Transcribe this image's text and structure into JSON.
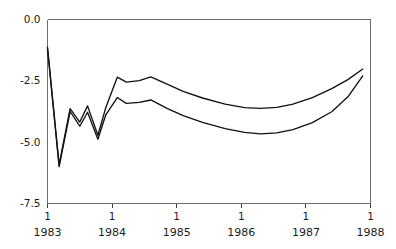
{
  "chart_data": {
    "type": "line",
    "title": "",
    "subtitle": "",
    "xlabel": "",
    "ylabel": "",
    "xlim": [
      1983.0,
      1988.0
    ],
    "ylim": [
      -7.5,
      0.0
    ],
    "grid": false,
    "legend": null,
    "legend_position": "none",
    "y_ticks": [
      0.0,
      -2.5,
      -5.0,
      -7.5
    ],
    "y_tick_labels": [
      "0.0",
      "-2.5",
      "-5.0",
      "-7.5"
    ],
    "x_ticks": [
      1983,
      1984,
      1985,
      1986,
      1987,
      1988
    ],
    "x_tick_labels": [
      "1",
      "1",
      "1",
      "1",
      "1",
      "1"
    ],
    "x_year_labels": [
      "1983",
      "1984",
      "1985",
      "1986",
      "1987",
      "1988"
    ],
    "line_color": "#111111",
    "axis_color": "#6e6e6e",
    "series": [
      {
        "name": "upper",
        "x": [
          1983.0,
          1983.18,
          1983.35,
          1983.5,
          1983.62,
          1983.78,
          1983.9,
          1984.08,
          1984.22,
          1984.42,
          1984.6,
          1984.85,
          1985.1,
          1985.4,
          1985.75,
          1986.05,
          1986.3,
          1986.55,
          1986.8,
          1987.1,
          1987.4,
          1987.65,
          1987.88
        ],
        "y": [
          -1.13,
          -5.92,
          -3.63,
          -4.18,
          -3.52,
          -4.72,
          -3.61,
          -2.35,
          -2.55,
          -2.49,
          -2.34,
          -2.63,
          -2.93,
          -3.2,
          -3.45,
          -3.59,
          -3.62,
          -3.58,
          -3.45,
          -3.18,
          -2.82,
          -2.45,
          -2.02
        ]
      },
      {
        "name": "lower",
        "x": [
          1983.0,
          1983.18,
          1983.35,
          1983.5,
          1983.62,
          1983.78,
          1983.9,
          1984.08,
          1984.22,
          1984.42,
          1984.6,
          1984.85,
          1985.1,
          1985.4,
          1985.75,
          1986.05,
          1986.3,
          1986.55,
          1986.8,
          1987.1,
          1987.4,
          1987.65,
          1987.88
        ],
        "y": [
          -1.18,
          -6.0,
          -3.75,
          -4.35,
          -3.78,
          -4.88,
          -3.9,
          -3.18,
          -3.42,
          -3.38,
          -3.28,
          -3.62,
          -3.92,
          -4.19,
          -4.45,
          -4.6,
          -4.66,
          -4.62,
          -4.49,
          -4.2,
          -3.76,
          -3.15,
          -2.3
        ]
      }
    ]
  }
}
